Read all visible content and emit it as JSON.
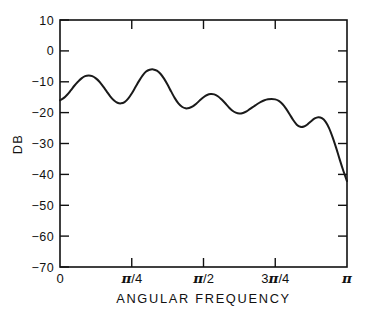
{
  "chart_data": {
    "type": "line",
    "title": "",
    "xlabel": "ANGULAR FREQUENCY",
    "ylabel": "DB",
    "xlim": [
      0,
      3.14159265
    ],
    "ylim": [
      -70,
      10
    ],
    "grid": false,
    "legend": null,
    "x_tick_labels": [
      "0",
      "π/4",
      "π/2",
      "3π/4",
      "π"
    ],
    "x_tick_values": [
      0,
      0.7853981634,
      1.5707963268,
      2.3561944902,
      3.14159265
    ],
    "y_tick_labels": [
      "10",
      "0",
      "−10",
      "−20",
      "−30",
      "−40",
      "−50",
      "−60",
      "−70"
    ],
    "y_tick_values": [
      10,
      0,
      -10,
      -20,
      -30,
      -40,
      -50,
      -60,
      -70
    ],
    "line_color": "#1a1a1a",
    "line_width_px": 2.0,
    "series": [
      {
        "name": "magnitude response",
        "x": [
          0.0,
          0.0393,
          0.0785,
          0.1178,
          0.1571,
          0.1963,
          0.2356,
          0.2749,
          0.3142,
          0.3534,
          0.3927,
          0.432,
          0.4712,
          0.5105,
          0.5498,
          0.589,
          0.6283,
          0.6676,
          0.7069,
          0.7461,
          0.7854,
          0.8247,
          0.8639,
          0.9032,
          0.9425,
          0.9817,
          1.021,
          1.0603,
          1.0996,
          1.1388,
          1.1781,
          1.2174,
          1.2566,
          1.2959,
          1.3352,
          1.3744,
          1.4137,
          1.453,
          1.4923,
          1.5315,
          1.5708,
          1.6101,
          1.6493,
          1.6886,
          1.7279,
          1.7671,
          1.8064,
          1.8457,
          1.885,
          1.9242,
          1.9635,
          2.0028,
          2.042,
          2.0813,
          2.1206,
          2.1598,
          2.1991,
          2.2384,
          2.2777,
          2.3169,
          2.3562,
          2.3955,
          2.4347,
          2.474,
          2.5133,
          2.5525,
          2.5918,
          2.6311,
          2.6704,
          2.7096,
          2.7489,
          2.7882,
          2.8274,
          2.8667,
          2.906,
          2.9452,
          2.9845,
          3.0238,
          3.0631,
          3.1023,
          3.14159265
        ],
        "y": [
          -16.0,
          -15.3,
          -14.2,
          -12.8,
          -11.3,
          -10.0,
          -8.9,
          -8.2,
          -8.0,
          -8.2,
          -8.9,
          -10.0,
          -11.5,
          -13.1,
          -14.7,
          -16.0,
          -16.8,
          -17.0,
          -16.6,
          -15.5,
          -13.8,
          -11.8,
          -9.8,
          -8.0,
          -6.7,
          -6.1,
          -6.0,
          -6.4,
          -7.4,
          -9.0,
          -11.0,
          -13.2,
          -15.3,
          -17.0,
          -18.1,
          -18.6,
          -18.5,
          -18.0,
          -17.1,
          -16.0,
          -15.0,
          -14.3,
          -14.0,
          -14.1,
          -14.7,
          -15.7,
          -16.9,
          -18.2,
          -19.3,
          -20.0,
          -20.3,
          -20.1,
          -19.6,
          -18.8,
          -18.0,
          -17.2,
          -16.5,
          -16.0,
          -15.7,
          -15.6,
          -15.7,
          -16.2,
          -17.2,
          -18.7,
          -20.5,
          -22.4,
          -23.9,
          -24.6,
          -24.5,
          -23.8,
          -22.8,
          -21.9,
          -21.5,
          -21.8,
          -22.9,
          -25.0,
          -28.0,
          -31.5,
          -35.3,
          -38.9,
          -42.2
        ],
        "y_tail_x": [
          3.14159265
        ],
        "comment_ripple_peaks_db": [
          -8.0,
          -6.0,
          -14.0,
          -21.5
        ],
        "comment_ripple_valleys_db": [
          -17.0,
          -18.6,
          -20.3,
          -24.6
        ]
      }
    ]
  },
  "axes": {
    "y_axis_label": "DB",
    "x_axis_label": "ANGULAR FREQUENCY",
    "y_ticks": [
      {
        "label": "10",
        "value": 10
      },
      {
        "label": "0",
        "value": 0
      },
      {
        "label": "−10",
        "value": -10
      },
      {
        "label": "−20",
        "value": -20
      },
      {
        "label": "−30",
        "value": -30
      },
      {
        "label": "−40",
        "value": -40
      },
      {
        "label": "−50",
        "value": -50
      },
      {
        "label": "−60",
        "value": -60
      },
      {
        "label": "−70",
        "value": -70
      }
    ],
    "x_ticks": [
      {
        "label": "0",
        "pi_numerator": "",
        "pi_denominator": "",
        "value": 0
      },
      {
        "label": "π/4",
        "pi_numerator": "",
        "pi_denominator": "4",
        "value": 0.7853981634
      },
      {
        "label": "π/2",
        "pi_numerator": "",
        "pi_denominator": "2",
        "value": 1.5707963268
      },
      {
        "label": "3π/4",
        "pi_numerator": "3",
        "pi_denominator": "4",
        "value": 2.3561944902
      },
      {
        "label": "π",
        "pi_numerator": "",
        "pi_denominator": "",
        "value": 3.14159265
      }
    ]
  },
  "style": {
    "frame_color": "#111111",
    "curve_color": "#1a1a1a",
    "background": "#ffffff"
  }
}
